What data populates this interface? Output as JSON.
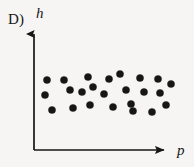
{
  "figure": {
    "choice_label": "D)",
    "background_color": "#f6f5f3",
    "ink_color": "#161616",
    "width": 194,
    "height": 167
  },
  "axes": {
    "y_label": "h",
    "x_label": "p",
    "origin": {
      "x": 34,
      "y": 150
    },
    "y_axis_top": 28,
    "x_axis_right": 170,
    "arrowheads": true,
    "tick_marks": false,
    "gridlines": false
  },
  "chart_data": {
    "type": "scatter",
    "title": "",
    "xlabel": "p",
    "ylabel": "h",
    "grid": false,
    "legend": null,
    "annotations": [
      "D)"
    ],
    "marker": {
      "shape": "circle",
      "filled": true,
      "color": "#161616",
      "radius_px": 3.6
    },
    "xlim": [
      34,
      178
    ],
    "ylim": [
      150,
      28
    ],
    "points": [
      {
        "x": 47,
        "y": 80
      },
      {
        "x": 64,
        "y": 80
      },
      {
        "x": 88,
        "y": 77
      },
      {
        "x": 93,
        "y": 87
      },
      {
        "x": 109,
        "y": 79
      },
      {
        "x": 120,
        "y": 74
      },
      {
        "x": 140,
        "y": 78
      },
      {
        "x": 158,
        "y": 79
      },
      {
        "x": 171,
        "y": 84
      },
      {
        "x": 45,
        "y": 95
      },
      {
        "x": 70,
        "y": 90
      },
      {
        "x": 82,
        "y": 92
      },
      {
        "x": 104,
        "y": 94
      },
      {
        "x": 126,
        "y": 90
      },
      {
        "x": 144,
        "y": 92
      },
      {
        "x": 160,
        "y": 93
      },
      {
        "x": 52,
        "y": 110
      },
      {
        "x": 73,
        "y": 108
      },
      {
        "x": 90,
        "y": 105
      },
      {
        "x": 113,
        "y": 107
      },
      {
        "x": 131,
        "y": 104
      },
      {
        "x": 133,
        "y": 111
      },
      {
        "x": 152,
        "y": 112
      },
      {
        "x": 166,
        "y": 105
      }
    ]
  }
}
